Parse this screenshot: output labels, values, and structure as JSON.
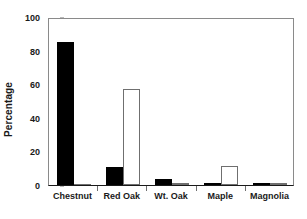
{
  "chart_data": {
    "type": "bar",
    "title": "",
    "subtitle": "",
    "xlabel": "",
    "ylabel": "Percentage",
    "categories": [
      "Chestnut",
      "Red Oak",
      "Wt. Oak",
      "Maple",
      "Magnolia"
    ],
    "series": [
      {
        "name": "Series 1",
        "fill": "#000000",
        "style": "filled",
        "values": [
          85,
          11,
          3.5,
          1.2,
          1.2
        ]
      },
      {
        "name": "Series 2",
        "fill": "#ffffff",
        "style": "open",
        "values": [
          0,
          57,
          1,
          11.5,
          1
        ]
      }
    ],
    "ylim": [
      0,
      100
    ],
    "yticks": [
      0,
      20,
      40,
      60,
      80,
      100
    ],
    "ytick_labels": [
      "0",
      "20",
      "40",
      "60",
      "80",
      "100"
    ],
    "grid": false,
    "legend": "none",
    "axis_color": "#1a1a1a",
    "frame_color": "#8a8a8a"
  }
}
